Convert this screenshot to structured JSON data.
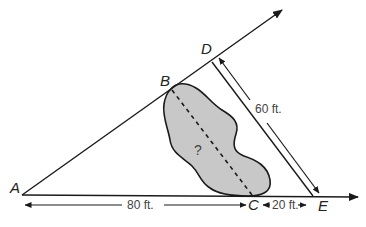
{
  "diagram": {
    "type": "similar-triangles-distance-across-pond",
    "points": {
      "A": "A",
      "B": "B",
      "C": "C",
      "D": "D",
      "E": "E"
    },
    "unknown_label": "?",
    "measurements": {
      "AC": "80 ft.",
      "CE": "20 ft.",
      "DE": "60 ft."
    },
    "colors": {
      "line": "#1a1a1a",
      "pond_fill": "#c8c8c8",
      "text": "#222222",
      "dim_text": "#444444"
    }
  }
}
